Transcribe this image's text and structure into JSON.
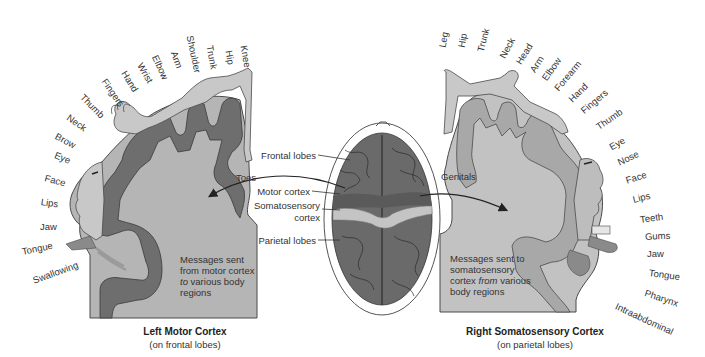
{
  "figure": {
    "left_panel": {
      "title": "Left Motor Cortex",
      "subtitle": "(on frontal lobes)",
      "message_lines": [
        "Messages sent",
        "from motor cortex",
        "to various body",
        "regions"
      ],
      "message_italic_word": "to",
      "body_labels": [
        {
          "text": "Knee",
          "x": 244,
          "y": 40,
          "rot": 80
        },
        {
          "text": "Hip",
          "x": 229,
          "y": 45,
          "rot": 80
        },
        {
          "text": "Trunk",
          "x": 210,
          "y": 40,
          "rot": 80
        },
        {
          "text": "Shoulder",
          "x": 190,
          "y": 30,
          "rot": 78
        },
        {
          "text": "Arm",
          "x": 174,
          "y": 46,
          "rot": 70
        },
        {
          "text": "Elbow",
          "x": 155,
          "y": 50,
          "rot": 65
        },
        {
          "text": "Wrist",
          "x": 140,
          "y": 58,
          "rot": 60
        },
        {
          "text": "Hand",
          "x": 124,
          "y": 66,
          "rot": 58
        },
        {
          "text": "Fingers",
          "x": 104,
          "y": 74,
          "rot": 55
        },
        {
          "text": "Thumb",
          "x": 82,
          "y": 90,
          "rot": 45
        },
        {
          "text": "Neck",
          "x": 68,
          "y": 111,
          "rot": 35
        },
        {
          "text": "Brow",
          "x": 56,
          "y": 130,
          "rot": 28
        },
        {
          "text": "Eye",
          "x": 55,
          "y": 149,
          "rot": 22
        },
        {
          "text": "Face",
          "x": 45,
          "y": 172,
          "rot": 15
        },
        {
          "text": "Lips",
          "x": 41,
          "y": 196,
          "rot": 8
        },
        {
          "text": "Jaw",
          "x": 40,
          "y": 221,
          "rot": 0
        },
        {
          "text": "Tongue",
          "x": 22,
          "y": 246,
          "rot": -12
        },
        {
          "text": "Swallowing",
          "x": 33,
          "y": 275,
          "rot": -20
        },
        {
          "text": "Toes",
          "x": 236,
          "y": 172,
          "rot": 0
        }
      ]
    },
    "center": {
      "labels": [
        "Frontal lobes",
        "Motor cortex",
        "Somatosensory",
        "cortex",
        "Parietal lobes"
      ]
    },
    "right_panel": {
      "title": "Right Somatosensory Cortex",
      "subtitle": "(on parietal lobes)",
      "message_lines": [
        "Messages sent to",
        "somatosensory",
        "cortex from various",
        "body regions"
      ],
      "message_italic_word": "from",
      "body_labels": [
        {
          "text": "Leg",
          "x": 442,
          "y": 42,
          "rot": -80
        },
        {
          "text": "Hip",
          "x": 461,
          "y": 42,
          "rot": -80
        },
        {
          "text": "Trunk",
          "x": 480,
          "y": 46,
          "rot": -75
        },
        {
          "text": "Neck",
          "x": 502,
          "y": 52,
          "rot": -62
        },
        {
          "text": "Head",
          "x": 518,
          "y": 58,
          "rot": -58
        },
        {
          "text": "Arm",
          "x": 532,
          "y": 66,
          "rot": -58
        },
        {
          "text": "Elbow",
          "x": 544,
          "y": 74,
          "rot": -55
        },
        {
          "text": "Forearm",
          "x": 556,
          "y": 84,
          "rot": -50
        },
        {
          "text": "Hand",
          "x": 570,
          "y": 95,
          "rot": -45
        },
        {
          "text": "Fingers",
          "x": 582,
          "y": 106,
          "rot": -40
        },
        {
          "text": "Thumb",
          "x": 597,
          "y": 122,
          "rot": -35
        },
        {
          "text": "Eye",
          "x": 610,
          "y": 142,
          "rot": -30
        },
        {
          "text": "Nose",
          "x": 618,
          "y": 157,
          "rot": -25
        },
        {
          "text": "Face",
          "x": 626,
          "y": 175,
          "rot": -18
        },
        {
          "text": "Lips",
          "x": 633,
          "y": 194,
          "rot": -14
        },
        {
          "text": "Teeth",
          "x": 640,
          "y": 214,
          "rot": -8
        },
        {
          "text": "Gums",
          "x": 645,
          "y": 231,
          "rot": -3
        },
        {
          "text": "Jaw",
          "x": 647,
          "y": 248,
          "rot": 0
        },
        {
          "text": "Tongue",
          "x": 649,
          "y": 267,
          "rot": 8
        },
        {
          "text": "Pharynx",
          "x": 645,
          "y": 287,
          "rot": 18
        },
        {
          "text": "Intraabdominal",
          "x": 616,
          "y": 300,
          "rot": 25
        },
        {
          "text": "Genitals",
          "x": 441,
          "y": 171,
          "rot": 0
        }
      ]
    },
    "colors": {
      "cortex_body": "#b5b5b5",
      "motor_gyrus": "#6e6e6e",
      "sensory_gyrus": "#a8a8a8",
      "homunculus": "#c8c8c8",
      "outline": "#4a4a4a",
      "brain": "#6a6a6a",
      "brain_band": "#c4c4c4"
    }
  }
}
